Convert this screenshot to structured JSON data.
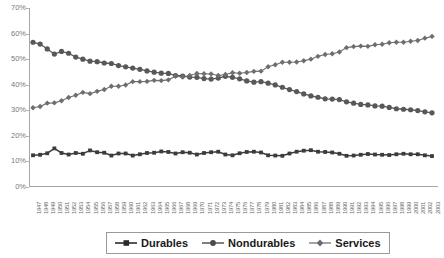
{
  "chart_data": {
    "type": "line",
    "title": "",
    "xlabel": "",
    "ylabel": "",
    "ylim": [
      0,
      70
    ],
    "yunit": "%",
    "grid": false,
    "legend_position": "bottom-center",
    "ytick_labels": [
      "70%",
      "60%",
      "50%",
      "40%",
      "30%",
      "20%",
      "10%",
      "0%"
    ],
    "ytick_values": [
      70,
      60,
      50,
      40,
      30,
      20,
      10,
      0
    ],
    "categories": [
      "1947",
      "1948",
      "1949",
      "1950",
      "1951",
      "1952",
      "1953",
      "1954",
      "1955",
      "1956",
      "1957",
      "1958",
      "1959",
      "1960",
      "1961",
      "1962",
      "1963",
      "1964",
      "1965",
      "1966",
      "1967",
      "1968",
      "1969",
      "1970",
      "1971",
      "1972",
      "1973",
      "1974",
      "1975",
      "1976",
      "1977",
      "1978",
      "1979",
      "1980",
      "1981",
      "1982",
      "1983",
      "1984",
      "1985",
      "1986",
      "1987",
      "1988",
      "1989",
      "1990",
      "1991",
      "1992",
      "1993",
      "1994",
      "1995",
      "1996",
      "1997",
      "1998",
      "1999",
      "2000",
      "2001",
      "2002",
      "2003"
    ],
    "series": [
      {
        "name": "Durables",
        "marker": "square",
        "color": "#3b3b3b",
        "values": [
          12.4,
          12.6,
          13.2,
          15.1,
          13.3,
          12.7,
          13.3,
          13.0,
          14.3,
          13.6,
          13.4,
          12.3,
          13.1,
          13.1,
          12.3,
          12.8,
          13.3,
          13.4,
          13.9,
          13.7,
          13.1,
          13.6,
          13.4,
          12.7,
          13.3,
          13.6,
          13.8,
          12.7,
          12.4,
          13.2,
          13.7,
          13.8,
          13.5,
          12.4,
          12.3,
          12.2,
          13.1,
          13.8,
          14.2,
          14.4,
          13.8,
          13.7,
          13.5,
          13.0,
          12.2,
          12.3,
          12.6,
          12.9,
          12.7,
          12.6,
          12.5,
          12.8,
          13.0,
          12.8,
          12.8,
          12.4,
          12.1
        ]
      },
      {
        "name": "Nondurables",
        "marker": "circle",
        "color": "#585858",
        "values": [
          56.6,
          55.9,
          54.0,
          52.0,
          53.0,
          52.3,
          50.8,
          50.0,
          49.2,
          49.0,
          48.5,
          48.3,
          47.5,
          47.0,
          46.5,
          46.0,
          45.4,
          44.9,
          44.5,
          44.4,
          43.6,
          43.4,
          43.0,
          42.9,
          42.4,
          42.2,
          42.6,
          43.3,
          42.9,
          42.3,
          41.5,
          41.0,
          41.2,
          40.6,
          39.9,
          39.0,
          38.1,
          37.3,
          36.4,
          35.6,
          35.1,
          34.5,
          34.4,
          34.2,
          33.3,
          32.8,
          32.3,
          32.1,
          31.7,
          31.6,
          31.1,
          30.6,
          30.4,
          30.2,
          29.9,
          29.4,
          29.0
        ]
      },
      {
        "name": "Services",
        "marker": "diamond",
        "color": "#6e6e6e",
        "values": [
          31.0,
          31.5,
          32.8,
          32.9,
          33.7,
          35.0,
          35.9,
          37.0,
          36.5,
          37.4,
          38.1,
          39.4,
          39.4,
          39.9,
          41.2,
          41.2,
          41.3,
          41.7,
          41.6,
          41.9,
          43.3,
          43.0,
          43.6,
          44.4,
          44.3,
          44.2,
          43.6,
          44.0,
          44.7,
          44.5,
          44.8,
          45.2,
          45.3,
          47.0,
          47.8,
          48.8,
          48.8,
          48.9,
          49.4,
          50.0,
          51.1,
          51.8,
          52.1,
          52.8,
          54.5,
          54.9,
          55.1,
          55.0,
          55.6,
          55.8,
          56.4,
          56.6,
          56.6,
          57.0,
          57.3,
          58.2,
          58.9
        ]
      }
    ]
  },
  "legend": {
    "items": [
      {
        "label": "Durables",
        "marker": "square-with-line"
      },
      {
        "label": "Nondurables",
        "marker": "circle-with-line"
      },
      {
        "label": "Services",
        "marker": "diamond-with-line"
      }
    ]
  }
}
